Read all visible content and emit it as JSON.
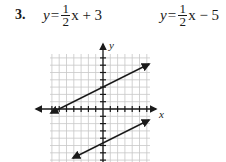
{
  "problem": {
    "number": "3.",
    "equations": [
      {
        "lhs": "y",
        "eq": "=",
        "numerator": "1",
        "denominator": "2",
        "rest": "x + 3"
      },
      {
        "lhs": "y",
        "eq": "=",
        "numerator": "1",
        "denominator": "2",
        "rest": "x − 5"
      }
    ]
  },
  "graph": {
    "x_label": "x",
    "y_label": "y",
    "grid": true,
    "line_color": "#1a1a1a",
    "grid_color": "#c8c8c8"
  },
  "chart_data": {
    "type": "line",
    "title": "",
    "xlabel": "x",
    "ylabel": "y",
    "grid": true,
    "xlim": [
      -7,
      6
    ],
    "ylim": [
      -7,
      7
    ],
    "series": [
      {
        "name": "y = 1/2 x + 3",
        "slope": 0.5,
        "intercept": 3,
        "x": [
          -6,
          6
        ],
        "y": [
          0,
          6
        ]
      },
      {
        "name": "y = 1/2 x - 5",
        "slope": 0.5,
        "intercept": -5,
        "x": [
          -3,
          6
        ],
        "y": [
          -6.5,
          -2
        ]
      }
    ]
  }
}
